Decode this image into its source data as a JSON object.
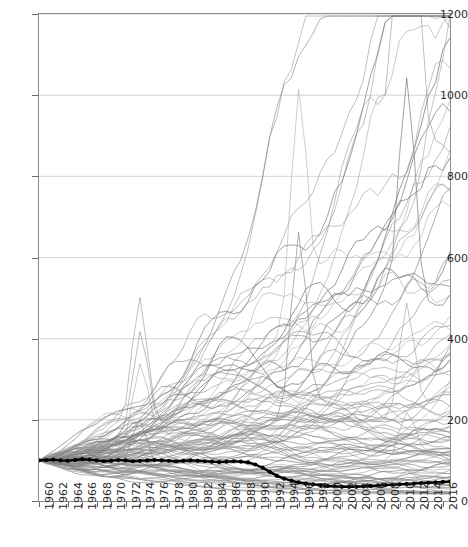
{
  "chart_data": {
    "type": "line",
    "title": "",
    "subtitle": "",
    "xlabel": "",
    "ylabel": "",
    "xlim": [
      1960,
      2017
    ],
    "ylim": [
      0,
      1200
    ],
    "grid": "horizontal",
    "legend": "none",
    "yticks": [
      0,
      200,
      400,
      600,
      800,
      1000,
      1200
    ],
    "xticks": [
      1960,
      1962,
      1964,
      1966,
      1968,
      1970,
      1972,
      1974,
      1976,
      1978,
      1980,
      1982,
      1984,
      1986,
      1988,
      1990,
      1992,
      1994,
      1996,
      1998,
      2000,
      2002,
      2004,
      2006,
      2008,
      2010,
      2012,
      2014,
      2016
    ],
    "x": [
      1960,
      1961,
      1962,
      1963,
      1964,
      1965,
      1966,
      1967,
      1968,
      1969,
      1970,
      1971,
      1972,
      1973,
      1974,
      1975,
      1976,
      1977,
      1978,
      1979,
      1980,
      1981,
      1982,
      1983,
      1984,
      1985,
      1986,
      1987,
      1988,
      1989,
      1990,
      1991,
      1992,
      1993,
      1994,
      1995,
      1996,
      1997,
      1998,
      1999,
      2000,
      2001,
      2002,
      2003,
      2004,
      2005,
      2006,
      2007,
      2008,
      2009,
      2010,
      2011,
      2012,
      2013,
      2014,
      2015,
      2016,
      2017
    ],
    "series": [
      {
        "name": "highlighted",
        "style": "bold-black-markers",
        "color": "#000000",
        "width": 2.4,
        "marker": "circle",
        "values": [
          100,
          101,
          102,
          100,
          99,
          101,
          103,
          102,
          100,
          98,
          99,
          101,
          100,
          98,
          99,
          100,
          101,
          100,
          99,
          98,
          99,
          100,
          99,
          98,
          97,
          96,
          97,
          98,
          97,
          95,
          90,
          82,
          72,
          62,
          55,
          50,
          46,
          43,
          41,
          39,
          37,
          36,
          35,
          35,
          35,
          36,
          37,
          38,
          39,
          40,
          41,
          42,
          43,
          44,
          45,
          46,
          47,
          48
        ]
      },
      {
        "name": "background-series",
        "style": "thin-gray",
        "color": "#8a8a8a",
        "width": 0.6,
        "count": 100,
        "base_value": 100,
        "base_year": 1960,
        "description": "Index series all starting at 100 in 1960, fanning out upward; envelope ranges roughly 30 to 1080 by 2017",
        "envelope_max_2017": 1080,
        "envelope_min_2017": 30,
        "notable_spikes": [
          {
            "year": 1974,
            "value": 450
          },
          {
            "year": 1996,
            "value": 640
          },
          {
            "year": 2011,
            "value": 930
          }
        ]
      }
    ]
  }
}
